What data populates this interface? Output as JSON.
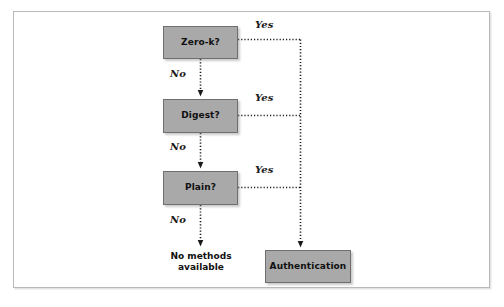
{
  "figure": {
    "kind": "decision-flowchart",
    "frame_border_color": "#b9b9b9",
    "node_fill_color": "#a9a9a9",
    "node_border_color": "#6f6f6f",
    "connector_color": "#222222",
    "connector_style": "dotted"
  },
  "nodes": {
    "zero_k": {
      "label": "Zero-k?"
    },
    "digest": {
      "label": "Digest?"
    },
    "plain": {
      "label": "Plain?"
    },
    "authentication": {
      "label": "Authentication"
    },
    "no_methods": {
      "label": "No methods\navailable"
    }
  },
  "edges": {
    "zero_k_yes": {
      "label": "Yes"
    },
    "zero_k_no": {
      "label": "No"
    },
    "digest_yes": {
      "label": "Yes"
    },
    "digest_no": {
      "label": "No"
    },
    "plain_yes": {
      "label": "Yes"
    },
    "plain_no": {
      "label": "No"
    }
  }
}
